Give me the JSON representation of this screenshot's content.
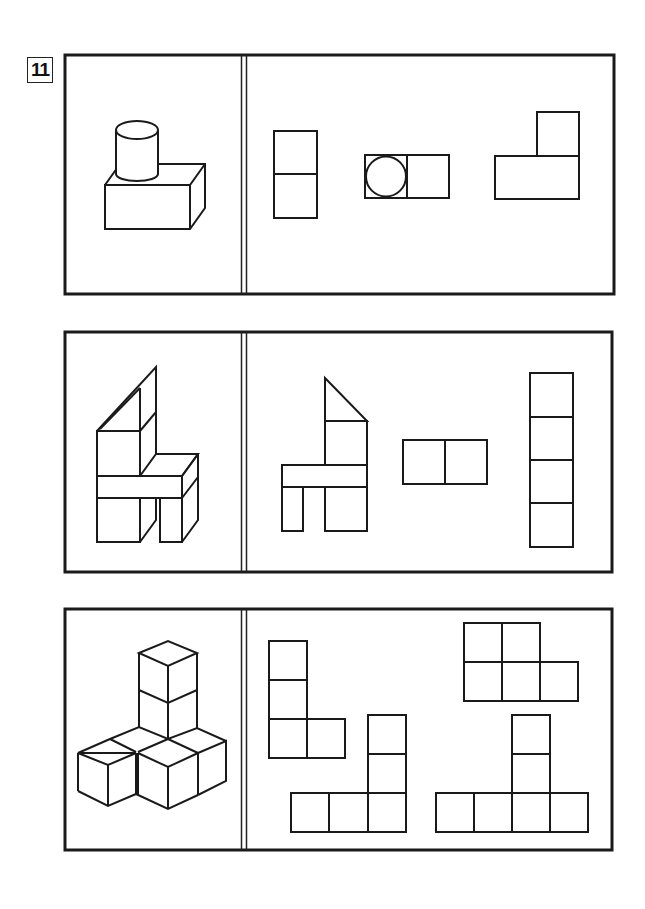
{
  "exercise": {
    "number": "11",
    "rows": [
      {
        "id": 1,
        "solid": "cylinder-on-rectangular-block",
        "views": [
          "front-view-two-stacked-rectangles",
          "top-view-circle-in-square-plus-square",
          "side-view-L-shape"
        ]
      },
      {
        "id": 2,
        "solid": "chair-of-blocks-with-triangular-prism-back",
        "views": [
          "front-view-chair-outline",
          "top-view-two-squares",
          "side-view-four-stacked-squares"
        ]
      },
      {
        "id": 3,
        "solid": "cube-assembly-tower-on-T-base",
        "views": [
          "L-tromino-plus-square",
          "T-shape-five-squares",
          "L-shape-five-squares",
          "inverted-T-six-squares"
        ]
      }
    ]
  },
  "colors": {
    "line": "#1a1a1a",
    "background": "#ffffff"
  }
}
